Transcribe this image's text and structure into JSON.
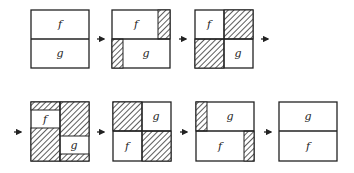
{
  "diagram": {
    "frames": [
      {
        "id": 1,
        "labels": {
          "top": "f",
          "bottom": "g"
        }
      },
      {
        "id": 2,
        "labels": {
          "top": "f",
          "bottom": "g"
        }
      },
      {
        "id": 3,
        "labels": {
          "top": "f",
          "bottom": "g"
        }
      },
      {
        "id": 4,
        "labels": {
          "top": "f",
          "bottom": "g"
        }
      },
      {
        "id": 5,
        "labels": {
          "top": "g",
          "bottom": "f"
        }
      },
      {
        "id": 6,
        "labels": {
          "top": "g",
          "bottom": "f"
        }
      },
      {
        "id": 7,
        "labels": {
          "top": "g",
          "bottom": "f"
        }
      }
    ],
    "colors": {
      "stroke": "#222222",
      "hatch": "#333333",
      "background": "#ffffff"
    }
  }
}
